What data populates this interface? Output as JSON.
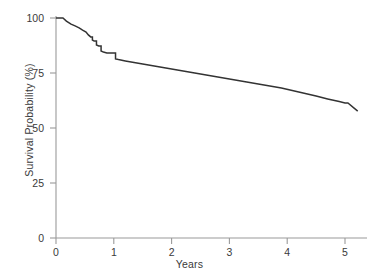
{
  "chart_data": {
    "type": "line",
    "title": "",
    "subtitle": "",
    "xlabel": "Years",
    "ylabel": "Survival Probability (%)",
    "xlim": [
      0,
      5.4
    ],
    "ylim": [
      0,
      100
    ],
    "xticks": [
      0,
      1,
      2,
      3,
      4,
      5
    ],
    "xtick_labels": [
      "0",
      "1",
      "2",
      "3",
      "4",
      "5"
    ],
    "yticks": [
      0,
      25,
      50,
      75,
      100
    ],
    "ytick_labels": [
      "0",
      "25",
      "50",
      "75",
      "100"
    ],
    "grid": false,
    "legend": "none",
    "line_color": "#333333",
    "axis_color": "#9a9a9a",
    "series": [
      {
        "name": "Survival",
        "style": "kaplan-meier-step",
        "x": [
          0.0,
          0.12,
          0.18,
          0.26,
          0.33,
          0.4,
          0.46,
          0.52,
          0.56,
          0.6,
          0.63,
          0.66,
          0.7,
          0.74,
          0.78,
          0.82,
          0.88,
          0.96,
          1.0,
          1.03,
          1.08,
          1.2,
          1.5,
          1.8,
          2.1,
          2.4,
          2.7,
          3.0,
          3.3,
          3.6,
          3.9,
          4.2,
          4.5,
          4.7,
          4.9,
          5.0,
          5.05,
          5.22
        ],
        "y": [
          100.0,
          100.0,
          98.6,
          97.2,
          96.4,
          95.5,
          94.5,
          93.6,
          92.3,
          91.4,
          90.0,
          89.5,
          87.7,
          87.3,
          85.0,
          84.5,
          84.1,
          84.1,
          84.1,
          81.4,
          81.1,
          80.5,
          79.1,
          77.7,
          76.4,
          75.0,
          73.6,
          72.3,
          70.9,
          69.5,
          68.2,
          66.4,
          64.5,
          63.2,
          62.0,
          61.4,
          61.4,
          57.7
        ]
      }
    ],
    "annotations": []
  },
  "axes": {
    "y_title": "Survival Probability (%)",
    "x_title": "Years",
    "y_tick_labels": [
      "100",
      "75",
      "50",
      "25",
      "0"
    ],
    "x_tick_labels": [
      "0",
      "1",
      "2",
      "3",
      "4",
      "5"
    ]
  }
}
